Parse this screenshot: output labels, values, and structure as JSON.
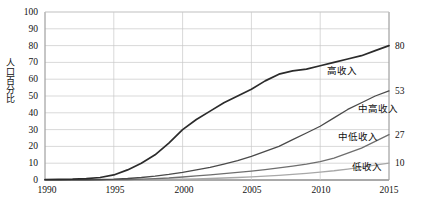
{
  "chart_data": {
    "type": "line",
    "title": "",
    "xlabel": "",
    "ylabel": "人口百分比",
    "xlim": [
      1990,
      2015
    ],
    "ylim": [
      0,
      100
    ],
    "grid": true,
    "legend_position": "inline-right",
    "x_ticks": [
      "1990",
      "1995",
      "2000",
      "2005",
      "2010",
      "2015"
    ],
    "y_ticks": [
      "0",
      "10",
      "20",
      "30",
      "40",
      "50",
      "60",
      "70",
      "80",
      "90",
      "100"
    ],
    "x": [
      1990,
      1991,
      1992,
      1993,
      1994,
      1995,
      1996,
      1997,
      1998,
      1999,
      2000,
      2001,
      2002,
      2003,
      2004,
      2005,
      2006,
      2007,
      2008,
      2009,
      2010,
      2011,
      2012,
      2013,
      2014,
      2015
    ],
    "series": [
      {
        "name": "高收入",
        "color": "#2b2b2b",
        "end_value": 80,
        "end_label": "80",
        "values": [
          0.3,
          0.4,
          0.5,
          0.8,
          1.5,
          3,
          6,
          10,
          15,
          22,
          30,
          36,
          41,
          46,
          50,
          54,
          59,
          63,
          65,
          66,
          68,
          70,
          72,
          74,
          77,
          80
        ]
      },
      {
        "name": "中高收入",
        "color": "#4a4a4a",
        "end_value": 53,
        "end_label": "53",
        "values": [
          0.05,
          0.07,
          0.1,
          0.15,
          0.3,
          0.5,
          0.9,
          1.5,
          2.3,
          3.3,
          4.5,
          6,
          7.5,
          9.5,
          11.5,
          14,
          17,
          20,
          24,
          28,
          32,
          37,
          42,
          46,
          50,
          53
        ]
      },
      {
        "name": "中低收入",
        "color": "#6e6e6e",
        "end_value": 27,
        "end_label": "27",
        "values": [
          0.02,
          0.03,
          0.04,
          0.06,
          0.1,
          0.2,
          0.3,
          0.5,
          0.8,
          1.2,
          1.8,
          2.4,
          3.1,
          3.8,
          4.5,
          5.3,
          6.2,
          7.2,
          8.3,
          9.5,
          11,
          13,
          16,
          19,
          23,
          27
        ]
      },
      {
        "name": "低收入",
        "color": "#a8a8a8",
        "end_value": 10,
        "end_label": "10",
        "values": [
          0.01,
          0.01,
          0.02,
          0.02,
          0.03,
          0.05,
          0.08,
          0.12,
          0.2,
          0.3,
          0.5,
          0.7,
          0.9,
          1.2,
          1.5,
          1.9,
          2.3,
          2.8,
          3.4,
          4.0,
          4.7,
          5.5,
          6.5,
          7.6,
          8.8,
          10
        ]
      }
    ],
    "series_label_positions": [
      {
        "name": "高收入",
        "x": 327,
        "y": 66
      },
      {
        "name": "中高收入",
        "x": 358,
        "y": 104
      },
      {
        "name": "中低收入",
        "x": 338,
        "y": 132
      },
      {
        "name": "低收入",
        "x": 352,
        "y": 162
      }
    ]
  }
}
